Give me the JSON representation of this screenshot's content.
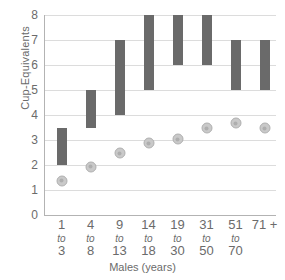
{
  "chart_data": {
    "type": "bar",
    "title": "",
    "subtitle": "",
    "xlabel": "Males (years)",
    "ylabel": "Cup-Equivalents",
    "ylim": [
      0,
      8
    ],
    "yticks": [
      0,
      1,
      2,
      3,
      4,
      5,
      6,
      7,
      8
    ],
    "ytick_labels": [
      "0",
      "1",
      "2",
      "3",
      "4",
      "5",
      "6",
      "7",
      "8"
    ],
    "grid": true,
    "legend": "none",
    "categories": [
      "1 to 3",
      "4 to 8",
      "9 to 13",
      "14 to 18",
      "19 to 30",
      "31 to 50",
      "51 to 70",
      "71 +"
    ],
    "category_lines": [
      {
        "top": "1",
        "mid": "to",
        "bottom": "3"
      },
      {
        "top": "4",
        "mid": "to",
        "bottom": "8"
      },
      {
        "top": "9",
        "mid": "to",
        "bottom": "13"
      },
      {
        "top": "14",
        "mid": "to",
        "bottom": "18"
      },
      {
        "top": "19",
        "mid": "to",
        "bottom": "30"
      },
      {
        "top": "31",
        "mid": "to",
        "bottom": "50"
      },
      {
        "top": "51",
        "mid": "to",
        "bottom": "70"
      },
      {
        "top": "71 +",
        "mid": "",
        "bottom": ""
      }
    ],
    "series": [
      {
        "name": "Recommended range",
        "type": "range-bar",
        "color": "#6a6a6a",
        "low": [
          2.0,
          3.5,
          4.0,
          5.0,
          6.0,
          6.0,
          5.0,
          5.0
        ],
        "high": [
          3.5,
          5.0,
          7.0,
          8.0,
          8.0,
          8.0,
          7.0,
          7.0
        ]
      },
      {
        "name": "Average intake",
        "type": "marker",
        "color": "#c9c9c9",
        "values": [
          1.6,
          2.15,
          2.7,
          3.1,
          3.25,
          3.7,
          3.9,
          3.7
        ]
      }
    ]
  }
}
